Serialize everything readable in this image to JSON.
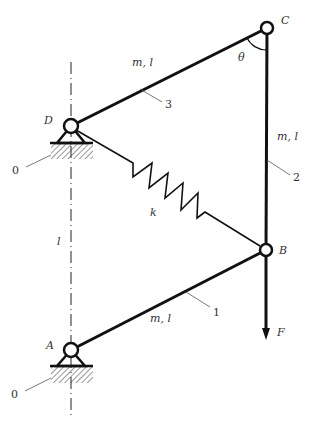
{
  "diagram": {
    "type": "mechanism",
    "colors": {
      "line": "#111111",
      "text": "#333333",
      "background": "#ffffff"
    },
    "points": {
      "A": {
        "label": "A"
      },
      "B": {
        "label": "B"
      },
      "C": {
        "label": "C"
      },
      "D": {
        "label": "D"
      }
    },
    "links": [
      {
        "id": "1",
        "label": "m, l",
        "number": "1",
        "from": "A",
        "to": "B"
      },
      {
        "id": "2",
        "label": "m, l",
        "number": "2",
        "from": "B",
        "to": "C"
      },
      {
        "id": "3",
        "label": "m, l",
        "number": "3",
        "from": "C",
        "to": "D"
      }
    ],
    "spring": {
      "label": "k",
      "from": "D",
      "to": "B"
    },
    "force": {
      "label": "F",
      "at": "B",
      "direction": "down"
    },
    "angle": {
      "label": "θ",
      "at": "C"
    },
    "distance": {
      "label": "l",
      "between": [
        "A",
        "D"
      ]
    },
    "ground": [
      {
        "label": "0",
        "at": "D"
      },
      {
        "label": "0",
        "at": "A"
      }
    ]
  }
}
